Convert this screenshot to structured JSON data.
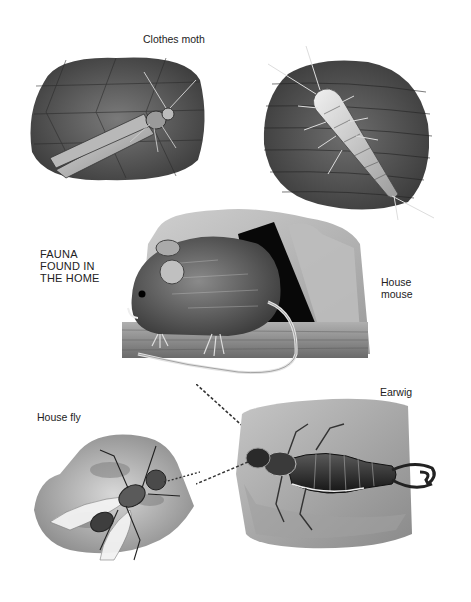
{
  "page": {
    "title": "FAUNA FOUND IN THE HOME",
    "title_lines": [
      "FAUNA",
      "FOUND IN",
      "THE HOME"
    ]
  },
  "specimens": [
    {
      "id": "clothes-moth",
      "label": "Clothes moth"
    },
    {
      "id": "silverfish",
      "label": ""
    },
    {
      "id": "house-mouse",
      "label": "House mouse",
      "label_lines": [
        "House",
        "mouse"
      ]
    },
    {
      "id": "house-fly",
      "label": "House fly"
    },
    {
      "id": "earwig",
      "label": "Earwig"
    }
  ],
  "colors": {
    "background": "#ffffff",
    "ink": "#1a1a1a",
    "stone_light": "#c9c9c9",
    "stone_mid": "#8a8a8a",
    "stone_dark": "#4a4a4a",
    "shadow": "#0a0a0a"
  }
}
